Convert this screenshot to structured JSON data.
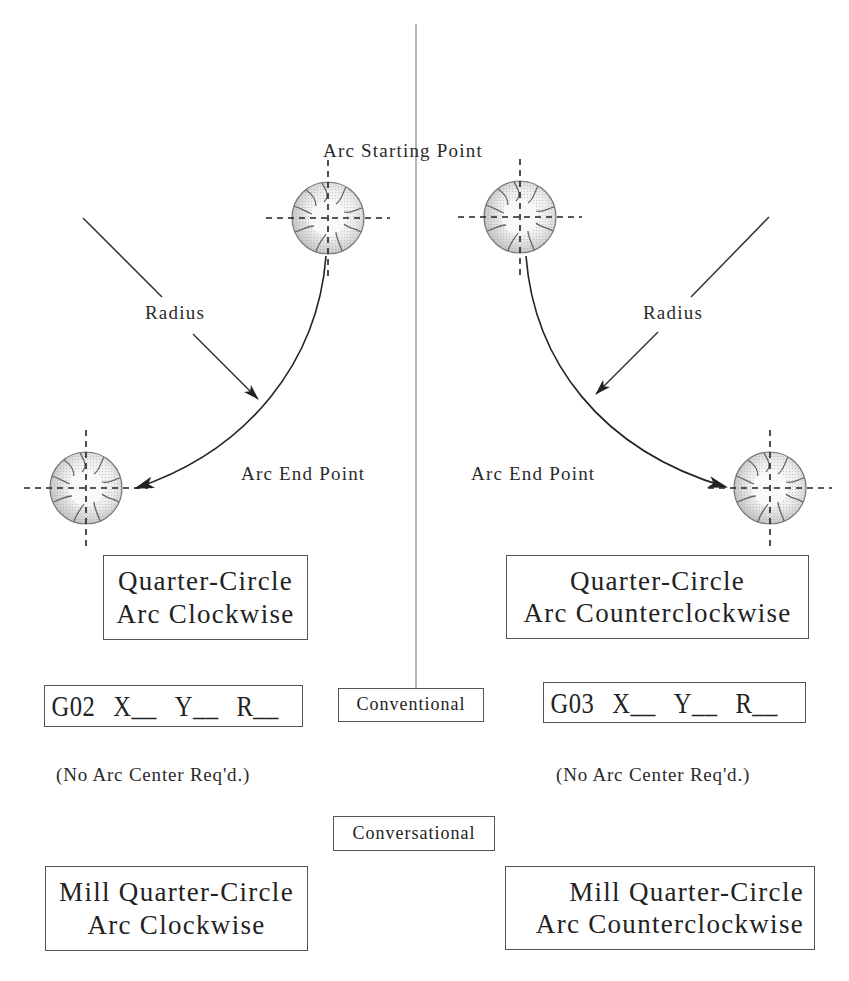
{
  "diagram": {
    "top_labels": {
      "arc_starting_point": "Arc Starting Point"
    },
    "left": {
      "radius_label": "Radius",
      "arc_end_point_label": "Arc End Point",
      "motion_box": {
        "line1": "Quarter-Circle",
        "line2": "Arc Clockwise"
      },
      "code_box": {
        "g_code": "G02",
        "x": "X__",
        "y": "Y__",
        "r": "R__"
      },
      "note": "(No Arc Center Req'd.)",
      "conversational_box": {
        "line1": "Mill Quarter-Circle",
        "line2": "Arc Clockwise"
      }
    },
    "right": {
      "radius_label": "Radius",
      "arc_end_point_label": "Arc End Point",
      "motion_box": {
        "line1": "Quarter-Circle",
        "line2": "Arc Counterclockwise"
      },
      "code_box": {
        "g_code": "G03",
        "x": "X__",
        "y": "Y__",
        "r": "R__"
      },
      "note": "(No Arc Center Req'd.)",
      "conversational_box": {
        "line1": "Mill Quarter-Circle",
        "line2": "Arc Counterclockwise"
      }
    },
    "center": {
      "conventional_label": "Conventional",
      "conversational_label": "Conversational"
    },
    "icons": {
      "cutter": "end-mill-cutter-icon",
      "crosshair": "dashed-centerline-crosshair"
    },
    "colors": {
      "line": "#333333",
      "divider": "#888888",
      "cutter_fill": "#d8d8d8",
      "box_border": "#555555"
    }
  }
}
